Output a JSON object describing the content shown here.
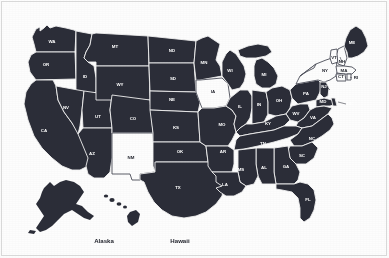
{
  "map": {
    "title": "United States Map",
    "colors": {
      "state_fill": "#2b2d38",
      "state_fill_highlight": "#fdfdfd",
      "state_border": "#f2f2f2",
      "label_text": "#ffffff",
      "label_text_highlight": "#24262f",
      "background": "#fdfdfd",
      "frame_border": "#d8d8d8"
    },
    "highlighted_states": [
      "IA",
      "NM",
      "NY",
      "VT",
      "NH",
      "MA",
      "CT",
      "RI"
    ],
    "insets": [
      {
        "name": "alaska-inset",
        "label": "Alaska",
        "x": 104,
        "y": 243
      },
      {
        "name": "hawaii-inset",
        "label": "Hawaii",
        "x": 180,
        "y": 243
      }
    ],
    "states": [
      {
        "code": "WA",
        "name": "Washington",
        "x": 52,
        "y": 42,
        "highlight": false
      },
      {
        "code": "OR",
        "name": "Oregon",
        "x": 46,
        "y": 65,
        "highlight": false
      },
      {
        "code": "ID",
        "name": "Idaho",
        "x": 85,
        "y": 77,
        "highlight": false
      },
      {
        "code": "MT",
        "name": "Montana",
        "x": 115,
        "y": 47,
        "highlight": false
      },
      {
        "code": "ND",
        "name": "North Dakota",
        "x": 172,
        "y": 51,
        "highlight": false
      },
      {
        "code": "SD",
        "name": "South Dakota",
        "x": 173,
        "y": 79,
        "highlight": false
      },
      {
        "code": "MN",
        "name": "Minnesota",
        "x": 204,
        "y": 63,
        "highlight": false
      },
      {
        "code": "WI",
        "name": "Wisconsin",
        "x": 230,
        "y": 71,
        "highlight": false
      },
      {
        "code": "MI",
        "name": "Michigan",
        "x": 264,
        "y": 75,
        "highlight": false
      },
      {
        "code": "WY",
        "name": "Wyoming",
        "x": 120,
        "y": 85,
        "highlight": false
      },
      {
        "code": "NV",
        "name": "Nevada",
        "x": 66,
        "y": 108,
        "highlight": false
      },
      {
        "code": "UT",
        "name": "Utah",
        "x": 98,
        "y": 117,
        "highlight": false
      },
      {
        "code": "CO",
        "name": "Colorado",
        "x": 133,
        "y": 119,
        "highlight": false
      },
      {
        "code": "NE",
        "name": "Nebraska",
        "x": 172,
        "y": 100,
        "highlight": false
      },
      {
        "code": "IA",
        "name": "Iowa",
        "x": 213,
        "y": 92,
        "highlight": true
      },
      {
        "code": "IL",
        "name": "Illinois",
        "x": 240,
        "y": 107,
        "highlight": false
      },
      {
        "code": "IN",
        "name": "Indiana",
        "x": 259,
        "y": 105,
        "highlight": false
      },
      {
        "code": "OH",
        "name": "Ohio",
        "x": 279,
        "y": 101,
        "highlight": false
      },
      {
        "code": "PA",
        "name": "Pennsylvania",
        "x": 306,
        "y": 94,
        "highlight": false
      },
      {
        "code": "NY",
        "name": "New York",
        "x": 325,
        "y": 71,
        "highlight": true
      },
      {
        "code": "VT",
        "name": "Vermont",
        "x": 334,
        "y": 58,
        "highlight": true
      },
      {
        "code": "NH",
        "name": "New Hampshire",
        "x": 342,
        "y": 62,
        "highlight": true
      },
      {
        "code": "ME",
        "name": "Maine",
        "x": 352,
        "y": 43,
        "highlight": false
      },
      {
        "code": "MA",
        "name": "Massachusetts",
        "x": 344,
        "y": 71,
        "highlight": true
      },
      {
        "code": "CT",
        "name": "Connecticut",
        "x": 341,
        "y": 77,
        "highlight": true
      },
      {
        "code": "RI",
        "name": "Rhode Island",
        "x": 356,
        "y": 78,
        "highlight": true
      },
      {
        "code": "NJ",
        "name": "New Jersey",
        "x": 324,
        "y": 87,
        "highlight": false
      },
      {
        "code": "DE",
        "name": "Delaware",
        "x": 350,
        "y": 104,
        "highlight": false
      },
      {
        "code": "MD",
        "name": "Maryland",
        "x": 323,
        "y": 102,
        "highlight": false
      },
      {
        "code": "WV",
        "name": "West Virginia",
        "x": 296,
        "y": 114,
        "highlight": false
      },
      {
        "code": "VA",
        "name": "Virginia",
        "x": 313,
        "y": 118,
        "highlight": false
      },
      {
        "code": "KY",
        "name": "Kentucky",
        "x": 268,
        "y": 124,
        "highlight": false
      },
      {
        "code": "MO",
        "name": "Missouri",
        "x": 222,
        "y": 125,
        "highlight": false
      },
      {
        "code": "KS",
        "name": "Kansas",
        "x": 176,
        "y": 128,
        "highlight": false
      },
      {
        "code": "OK",
        "name": "Oklahoma",
        "x": 180,
        "y": 152,
        "highlight": false
      },
      {
        "code": "AR",
        "name": "Arkansas",
        "x": 223,
        "y": 152,
        "highlight": false
      },
      {
        "code": "TN",
        "name": "Tennessee",
        "x": 263,
        "y": 144,
        "highlight": false
      },
      {
        "code": "NC",
        "name": "North Carolina",
        "x": 312,
        "y": 139,
        "highlight": false
      },
      {
        "code": "SC",
        "name": "South Carolina",
        "x": 302,
        "y": 156,
        "highlight": false
      },
      {
        "code": "GA",
        "name": "Georgia",
        "x": 286,
        "y": 167,
        "highlight": false
      },
      {
        "code": "AL",
        "name": "Alabama",
        "x": 264,
        "y": 168,
        "highlight": false
      },
      {
        "code": "MS",
        "name": "Mississippi",
        "x": 241,
        "y": 170,
        "highlight": false
      },
      {
        "code": "LA",
        "name": "Louisiana",
        "x": 225,
        "y": 185,
        "highlight": false
      },
      {
        "code": "TX",
        "name": "Texas",
        "x": 178,
        "y": 188,
        "highlight": false
      },
      {
        "code": "NM",
        "name": "New Mexico",
        "x": 131,
        "y": 158,
        "highlight": true
      },
      {
        "code": "AZ",
        "name": "Arizona",
        "x": 92,
        "y": 154,
        "highlight": false
      },
      {
        "code": "CA",
        "name": "California",
        "x": 44,
        "y": 131,
        "highlight": false
      },
      {
        "code": "FL",
        "name": "Florida",
        "x": 308,
        "y": 200,
        "highlight": false
      }
    ]
  }
}
